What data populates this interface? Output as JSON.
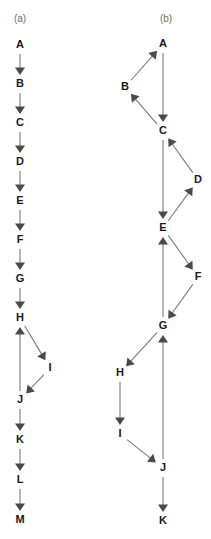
{
  "figure": {
    "background_color": "#ffffff",
    "node_text_color": "#1a1a1a",
    "edge_color": "#7a7a7a",
    "arrowhead_color": "#4a4a4a",
    "panel_label_color": "#6b6b6b",
    "width": 211,
    "height": 539
  },
  "chart_data": {
    "type": "diagram",
    "title": "",
    "subtitle": "",
    "xlabel": "",
    "ylabel": "",
    "panels": [
      {
        "id": "a",
        "label": "(a)",
        "label_x": 20,
        "label_y": 19,
        "nodes": [
          {
            "id": "A",
            "label": "A",
            "x": 20,
            "y": 45
          },
          {
            "id": "B",
            "label": "B",
            "x": 20,
            "y": 84
          },
          {
            "id": "C",
            "label": "C",
            "x": 20,
            "y": 123
          },
          {
            "id": "D",
            "label": "D",
            "x": 20,
            "y": 162
          },
          {
            "id": "E",
            "label": "E",
            "x": 20,
            "y": 201
          },
          {
            "id": "F",
            "label": "F",
            "x": 20,
            "y": 240
          },
          {
            "id": "G",
            "label": "G",
            "x": 20,
            "y": 279
          },
          {
            "id": "H",
            "label": "H",
            "x": 20,
            "y": 318
          },
          {
            "id": "I",
            "label": "I",
            "x": 50,
            "y": 368
          },
          {
            "id": "J",
            "label": "J",
            "x": 20,
            "y": 400
          },
          {
            "id": "K",
            "label": "K",
            "x": 20,
            "y": 440
          },
          {
            "id": "L",
            "label": "L",
            "x": 20,
            "y": 480
          },
          {
            "id": "M",
            "label": "M",
            "x": 20,
            "y": 520
          }
        ],
        "edges": [
          {
            "from": "A",
            "to": "B"
          },
          {
            "from": "B",
            "to": "C"
          },
          {
            "from": "C",
            "to": "D"
          },
          {
            "from": "D",
            "to": "E"
          },
          {
            "from": "E",
            "to": "F"
          },
          {
            "from": "F",
            "to": "G"
          },
          {
            "from": "G",
            "to": "H"
          },
          {
            "from": "H",
            "to": "I"
          },
          {
            "from": "I",
            "to": "J"
          },
          {
            "from": "J",
            "to": "H"
          },
          {
            "from": "J",
            "to": "K"
          },
          {
            "from": "K",
            "to": "L"
          },
          {
            "from": "L",
            "to": "M"
          }
        ]
      },
      {
        "id": "b",
        "label": "(b)",
        "label_x": 166,
        "label_y": 19,
        "nodes": [
          {
            "id": "A",
            "label": "A",
            "x": 163,
            "y": 44
          },
          {
            "id": "B",
            "label": "B",
            "x": 125,
            "y": 87
          },
          {
            "id": "C",
            "label": "C",
            "x": 163,
            "y": 131
          },
          {
            "id": "D",
            "label": "D",
            "x": 198,
            "y": 180
          },
          {
            "id": "E",
            "label": "E",
            "x": 163,
            "y": 228
          },
          {
            "id": "F",
            "label": "F",
            "x": 198,
            "y": 277
          },
          {
            "id": "G",
            "label": "G",
            "x": 163,
            "y": 326
          },
          {
            "id": "H",
            "label": "H",
            "x": 120,
            "y": 373
          },
          {
            "id": "I",
            "label": "I",
            "x": 120,
            "y": 434
          },
          {
            "id": "J",
            "label": "J",
            "x": 163,
            "y": 468
          },
          {
            "id": "K",
            "label": "K",
            "x": 163,
            "y": 521
          }
        ],
        "edges": [
          {
            "from": "B",
            "to": "A"
          },
          {
            "from": "A",
            "to": "C"
          },
          {
            "from": "C",
            "to": "B"
          },
          {
            "from": "D",
            "to": "C"
          },
          {
            "from": "C",
            "to": "E"
          },
          {
            "from": "E",
            "to": "D"
          },
          {
            "from": "E",
            "to": "F"
          },
          {
            "from": "F",
            "to": "G"
          },
          {
            "from": "G",
            "to": "E"
          },
          {
            "from": "G",
            "to": "H"
          },
          {
            "from": "H",
            "to": "I"
          },
          {
            "from": "I",
            "to": "J"
          },
          {
            "from": "J",
            "to": "G"
          },
          {
            "from": "J",
            "to": "K"
          }
        ]
      }
    ]
  }
}
